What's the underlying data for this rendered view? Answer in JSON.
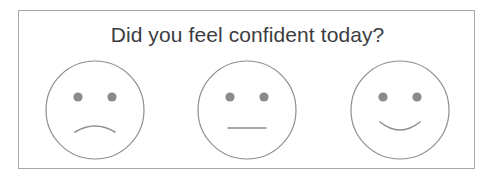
{
  "card": {
    "border_color": "#a8a8a8",
    "background_color": "#ffffff"
  },
  "question": {
    "title": "Did you feel confident today?",
    "text_color": "#3c3c41"
  },
  "scale": {
    "line_color": "#8e8e93",
    "eye_color": "#8a8a8f",
    "options": [
      {
        "id": "sad",
        "label": "Sad face",
        "mouth": "frown",
        "position": 1
      },
      {
        "id": "neutral",
        "label": "Neutral face",
        "mouth": "straight",
        "position": 2
      },
      {
        "id": "happy",
        "label": "Happy face",
        "mouth": "smile",
        "position": 3
      }
    ]
  }
}
